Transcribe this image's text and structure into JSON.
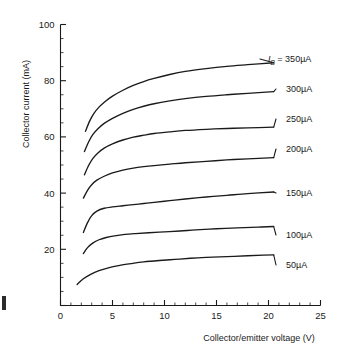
{
  "chart_data": {
    "type": "line",
    "title": "",
    "xlabel": "Collector/emitter voltage (V)",
    "ylabel": "Collector current (mA)",
    "xlim": [
      0,
      25
    ],
    "ylim": [
      0,
      100
    ],
    "x_major_ticks": [
      0,
      5,
      10,
      15,
      20,
      25
    ],
    "y_major_ticks": [
      0,
      20,
      40,
      60,
      80,
      100
    ],
    "x_minor_step": 1,
    "y_minor_step": 5,
    "grid": false,
    "legend_position": "right-inline",
    "legend_prefix": "I",
    "legend_prefix_sub": "B",
    "legend_prefix_eq": " = ",
    "series": [
      {
        "name": "350µA",
        "label": "350µA",
        "label_has_prefix": true,
        "points": [
          [
            2.4,
            62.0
          ],
          [
            2.8,
            65.6
          ],
          [
            3.2,
            68.3
          ],
          [
            3.7,
            70.6
          ],
          [
            4.3,
            72.6
          ],
          [
            5.0,
            74.5
          ],
          [
            6.0,
            76.6
          ],
          [
            7.0,
            78.3
          ],
          [
            8.0,
            79.7
          ],
          [
            9.0,
            80.8
          ],
          [
            10.5,
            82.2
          ],
          [
            12.0,
            83.3
          ],
          [
            14.0,
            84.3
          ],
          [
            16.0,
            85.1
          ],
          [
            18.0,
            85.7
          ],
          [
            20.5,
            86.4
          ]
        ]
      },
      {
        "name": "300µA",
        "label": "300µA",
        "label_has_prefix": false,
        "points": [
          [
            2.3,
            54.8
          ],
          [
            2.7,
            58.2
          ],
          [
            3.1,
            60.8
          ],
          [
            3.6,
            62.9
          ],
          [
            4.2,
            64.8
          ],
          [
            5.0,
            66.6
          ],
          [
            6.0,
            68.4
          ],
          [
            7.0,
            69.8
          ],
          [
            8.0,
            70.9
          ],
          [
            9.0,
            71.8
          ],
          [
            10.5,
            72.8
          ],
          [
            12.0,
            73.6
          ],
          [
            14.0,
            74.4
          ],
          [
            16.0,
            75.0
          ],
          [
            18.0,
            75.5
          ],
          [
            20.5,
            76.1
          ]
        ]
      },
      {
        "name": "250µA",
        "label": "250µA",
        "label_has_prefix": false,
        "points": [
          [
            2.3,
            46.5
          ],
          [
            2.7,
            49.8
          ],
          [
            3.1,
            52.3
          ],
          [
            3.6,
            54.3
          ],
          [
            4.2,
            56.0
          ],
          [
            5.0,
            57.5
          ],
          [
            6.0,
            58.9
          ],
          [
            7.0,
            59.9
          ],
          [
            8.0,
            60.6
          ],
          [
            9.0,
            61.2
          ],
          [
            10.5,
            61.8
          ],
          [
            12.0,
            62.3
          ],
          [
            14.0,
            62.7
          ],
          [
            16.0,
            63.0
          ],
          [
            18.0,
            63.2
          ],
          [
            20.5,
            63.5
          ]
        ]
      },
      {
        "name": "200µA",
        "label": "200µA",
        "label_has_prefix": false,
        "points": [
          [
            2.2,
            38.2
          ],
          [
            2.6,
            41.0
          ],
          [
            3.0,
            43.0
          ],
          [
            3.5,
            44.6
          ],
          [
            4.2,
            46.0
          ],
          [
            5.0,
            47.2
          ],
          [
            6.0,
            48.2
          ],
          [
            7.0,
            48.9
          ],
          [
            8.0,
            49.4
          ],
          [
            9.0,
            49.8
          ],
          [
            10.5,
            50.3
          ],
          [
            12.0,
            50.8
          ],
          [
            14.0,
            51.3
          ],
          [
            16.0,
            51.8
          ],
          [
            18.0,
            52.2
          ],
          [
            20.5,
            52.6
          ]
        ]
      },
      {
        "name": "150µA",
        "label": "150µA",
        "label_has_prefix": false,
        "points": [
          [
            2.2,
            26.0
          ],
          [
            2.6,
            29.5
          ],
          [
            3.0,
            32.0
          ],
          [
            3.5,
            33.6
          ],
          [
            4.2,
            34.6
          ],
          [
            5.0,
            35.1
          ],
          [
            6.0,
            35.5
          ],
          [
            7.0,
            35.9
          ],
          [
            8.0,
            36.3
          ],
          [
            9.0,
            36.7
          ],
          [
            10.5,
            37.3
          ],
          [
            12.0,
            37.9
          ],
          [
            14.0,
            38.6
          ],
          [
            16.0,
            39.2
          ],
          [
            18.0,
            39.8
          ],
          [
            20.5,
            40.4
          ]
        ]
      },
      {
        "name": "100µA",
        "label": "100µA",
        "label_has_prefix": false,
        "points": [
          [
            2.2,
            18.5
          ],
          [
            2.6,
            20.6
          ],
          [
            3.1,
            22.2
          ],
          [
            3.7,
            23.4
          ],
          [
            4.4,
            24.2
          ],
          [
            5.2,
            24.8
          ],
          [
            6.2,
            25.3
          ],
          [
            7.2,
            25.6
          ],
          [
            8.5,
            25.9
          ],
          [
            10.0,
            26.2
          ],
          [
            11.5,
            26.5
          ],
          [
            13.0,
            26.9
          ],
          [
            15.0,
            27.3
          ],
          [
            17.0,
            27.6
          ],
          [
            19.0,
            27.9
          ],
          [
            20.5,
            28.1
          ]
        ]
      },
      {
        "name": "50µA",
        "label": "50µA",
        "label_has_prefix": false,
        "points": [
          [
            1.6,
            7.5
          ],
          [
            2.2,
            9.5
          ],
          [
            2.9,
            11.1
          ],
          [
            3.7,
            12.4
          ],
          [
            4.6,
            13.4
          ],
          [
            5.6,
            14.2
          ],
          [
            6.8,
            14.9
          ],
          [
            8.0,
            15.5
          ],
          [
            9.5,
            16.0
          ],
          [
            11.0,
            16.4
          ],
          [
            12.5,
            16.8
          ],
          [
            14.0,
            17.1
          ],
          [
            16.0,
            17.4
          ],
          [
            18.0,
            17.7
          ],
          [
            19.5,
            17.9
          ],
          [
            20.5,
            18.0
          ]
        ]
      }
    ]
  }
}
